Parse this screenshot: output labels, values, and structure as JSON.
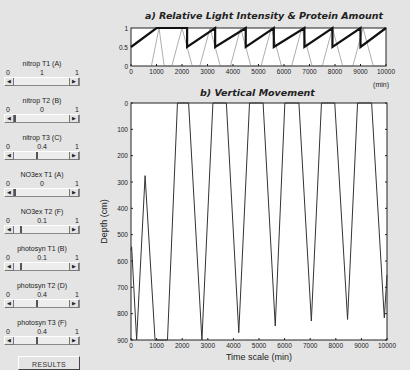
{
  "controls": [
    {
      "label": "nitrop T1 (A)",
      "min": "0",
      "max": "1",
      "value": "1",
      "pos": 1.0
    },
    {
      "label": "nitrop T2 (B)",
      "min": "0",
      "max": "1",
      "value": "0",
      "pos": 0.0
    },
    {
      "label": "nitrop T3 (C)",
      "min": "0",
      "max": "1",
      "value": "0.4",
      "pos": 0.4
    },
    {
      "label": "NO3ex T1 (A)",
      "min": "0",
      "max": "1",
      "value": "0",
      "pos": 0.0
    },
    {
      "label": "NO3ex T2 (F)",
      "min": "0",
      "max": "1",
      "value": "0.1",
      "pos": 0.1
    },
    {
      "label": "photosyn T1 (B)",
      "min": "0",
      "max": "1",
      "value": "0.1",
      "pos": 0.1
    },
    {
      "label": "photosyn T2 (D)",
      "min": "0",
      "max": "1",
      "value": "0.4",
      "pos": 0.4
    },
    {
      "label": "photosyn T3 (F)",
      "min": "0",
      "max": "1",
      "value": "0.4",
      "pos": 0.4
    }
  ],
  "results_button": "RESULTS",
  "chart_data": [
    {
      "type": "line",
      "title": "a)  Relative Light Intensity & Protein Amount",
      "xlabel": "(min)",
      "ylabel": "",
      "xlim": [
        0,
        10000
      ],
      "ylim": [
        0,
        1
      ],
      "xticks": [
        "0",
        "1000",
        "2000",
        "3000",
        "4000",
        "5000",
        "6000",
        "7000",
        "8000",
        "9000",
        "10000"
      ],
      "yticks": [
        "0",
        "0.5",
        "1"
      ],
      "grid": false,
      "series": [
        {
          "name": "Protein Amount (thick sawtooth)",
          "x": [
            0,
            1000,
            1000,
            2200,
            2200,
            3300,
            3300,
            4500,
            4500,
            5600,
            5600,
            6800,
            6800,
            7900,
            7900,
            9000,
            9000,
            10000
          ],
          "y": [
            0.5,
            1,
            1,
            1,
            0.5,
            1,
            0.5,
            1,
            0.5,
            1,
            0.5,
            1,
            0.5,
            1,
            0.5,
            1,
            0.5,
            1
          ]
        },
        {
          "name": "Relative Light Intensity (thin)",
          "x": [
            800,
            1100,
            1300,
            1600,
            2000,
            2400,
            2700,
            3100,
            3500,
            3900,
            4300,
            4700,
            5100,
            5500,
            5900,
            6300,
            6700,
            7100,
            7500,
            7900,
            8300,
            8700,
            9100,
            9500,
            9900
          ],
          "y": [
            0,
            1,
            0,
            0,
            1,
            0,
            0,
            1,
            0,
            0,
            1,
            0,
            0,
            1,
            0,
            0,
            1,
            0,
            0,
            1,
            0,
            0,
            1,
            0,
            0
          ]
        }
      ]
    },
    {
      "type": "line",
      "title": "b)  Vertical Movement",
      "xlabel": "Time scale (min)",
      "ylabel": "Depth (cm)",
      "xlim": [
        0,
        10000
      ],
      "ylim": [
        0,
        900
      ],
      "y_inverted": true,
      "xticks": [
        "0",
        "1000",
        "2000",
        "3000",
        "4000",
        "5000",
        "6000",
        "7000",
        "8000",
        "9000",
        "10000"
      ],
      "yticks": [
        "0",
        "100",
        "200",
        "300",
        "400",
        "500",
        "600",
        "700",
        "800",
        "900"
      ],
      "grid": false,
      "series": [
        {
          "name": "Depth",
          "x": [
            0,
            25,
            220,
            550,
            940,
            1425,
            1815,
            2250,
            2770,
            3200,
            3725,
            4210,
            4630,
            5160,
            5635,
            6010,
            6560,
            7045,
            7440,
            7960,
            8460,
            8850,
            9400,
            9895,
            10000
          ],
          "y": [
            560,
            546,
            900,
            276,
            900,
            900,
            0,
            0,
            900,
            0,
            0,
            872,
            0,
            0,
            847,
            0,
            0,
            828,
            0,
            0,
            822,
            0,
            0,
            816,
            653
          ]
        }
      ]
    }
  ]
}
